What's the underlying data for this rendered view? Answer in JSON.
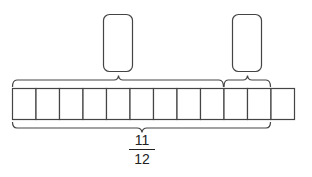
{
  "diagram": {
    "type": "fraction-bar-model",
    "total_parts": 12,
    "top_braces": [
      {
        "parts": 9,
        "answer_box": ""
      },
      {
        "parts": 2,
        "answer_box": ""
      }
    ],
    "bottom_brace": {
      "parts": 11
    },
    "fraction_label": {
      "numerator": "11",
      "denominator": "12"
    },
    "stroke_color": "#333333"
  }
}
